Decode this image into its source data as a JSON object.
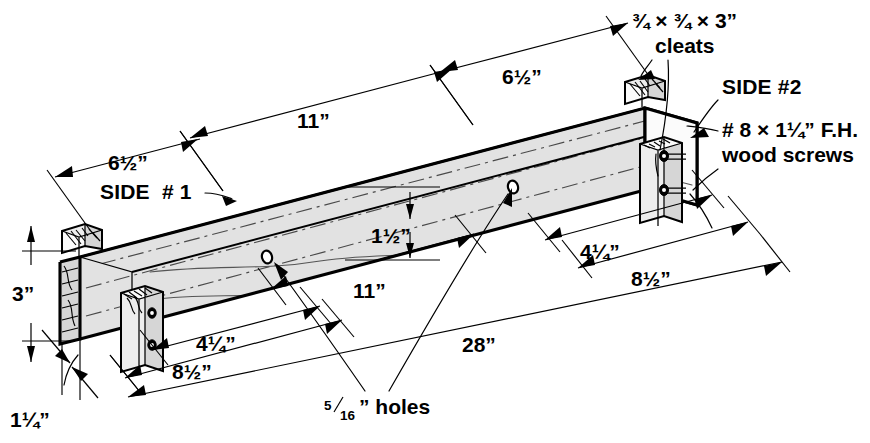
{
  "drawing": {
    "type": "isometric-technical-drawing",
    "subject": "wood beam with cleats and screw holes",
    "background_color": "#ffffff",
    "line_color": "#000000",
    "face_fill_color": "#ededed"
  },
  "labels": {
    "cleats": {
      "size": "¾ × ¾ × 3”",
      "name": "cleats"
    },
    "screws": {
      "spec": "# 8 × 1¼” F.H.",
      "name": "wood screws"
    },
    "holes": {
      "numerator": "5",
      "denominator": "16",
      "suffix": "” holes"
    },
    "side_1": "SIDE  # 1",
    "side_2": "SIDE #2"
  },
  "dimensions": {
    "top_left_6_half": "6½”",
    "top_11": "11”",
    "top_right_6_half": "6½”",
    "height_3": "3”",
    "thickness_1_quarter": "1¼”",
    "offset_1_half": "1½”",
    "bottom_left_4_quarter": "4¼”",
    "bottom_left_8_half": "8½”",
    "bottom_11": "11”",
    "bottom_right_4_quarter": "4¼”",
    "bottom_right_8_half": "8½”",
    "overall_28": "28”"
  }
}
